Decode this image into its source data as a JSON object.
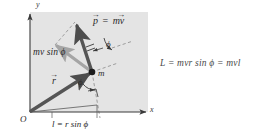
{
  "figure": {
    "title_alt": "Angular momentum of a particle about the origin",
    "background_color": "#ffffff",
    "shaded_plane_color": "#e4e4e4",
    "vector_color": "#4d4d4d",
    "component_vector_color": "#a0a0a0",
    "axis_color": "#3a3a3a",
    "dashed_color": "#7a7a7a",
    "text_color": "#2a2a2a"
  },
  "axes": {
    "x_label": "x",
    "y_label": "y",
    "origin_label": "O"
  },
  "labels": {
    "momentum_vector": "p",
    "momentum_equation_rhs": "mv",
    "momentum_equals": "=",
    "position_vector": "r",
    "mass_point": "m",
    "perpendicular_component": "mv sin ϕ",
    "angle_at_origin": "ϕ",
    "angle_at_mass": "ϕ",
    "moment_arm": "l = r sin ϕ",
    "angular_momentum_equation": "L = mvr sin ϕ = mvl"
  },
  "geometry": {
    "origin": [
      30,
      112
    ],
    "mass_point": [
      92,
      72
    ],
    "momentum_tip": [
      75,
      22
    ],
    "component_tip": [
      55,
      45
    ],
    "foot_of_perpendicular": [
      97,
      113
    ],
    "x_axis_end": [
      148,
      112
    ],
    "y_axis_top": [
      30,
      12
    ],
    "moment_arm_length_label": "l = r sin ϕ"
  }
}
